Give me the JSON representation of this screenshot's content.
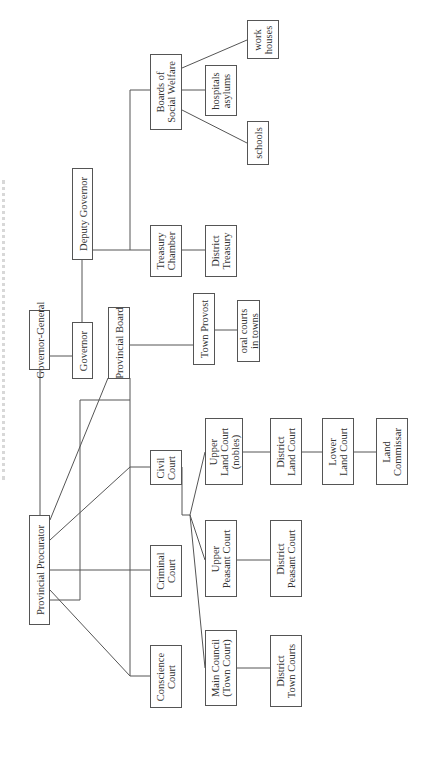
{
  "title": "",
  "line_color": "#555555",
  "nodes": {
    "governor_general": {
      "label": "Governor-General",
      "x": 29,
      "y": 310,
      "w": 21,
      "h": 60
    },
    "provincial_procurator": {
      "label": "Provincial Procurator",
      "x": 29,
      "y": 515,
      "w": 21,
      "h": 110
    },
    "governor": {
      "label": "Governor",
      "x": 72,
      "y": 322,
      "w": 21,
      "h": 57
    },
    "deputy_governor": {
      "label": "Deputy Governor",
      "x": 72,
      "y": 168,
      "w": 21,
      "h": 92
    },
    "provincial_board": {
      "label": "Provincial Board",
      "x": 108,
      "y": 307,
      "w": 22,
      "h": 72
    },
    "town_provost": {
      "label": "Town Provost",
      "x": 193,
      "y": 293,
      "w": 22,
      "h": 72
    },
    "oral_courts": {
      "label": "oral courts\nin towns",
      "x": 237,
      "y": 300,
      "w": 23,
      "h": 62
    },
    "treasury_chamber": {
      "label": "Treasury\nChamber",
      "x": 150,
      "y": 225,
      "w": 32,
      "h": 52
    },
    "district_treasury": {
      "label": "District\nTreasury",
      "x": 205,
      "y": 225,
      "w": 32,
      "h": 52
    },
    "boards_social_welfare": {
      "label": "Boards of\nSocial Welfare",
      "x": 150,
      "y": 54,
      "w": 32,
      "h": 76
    },
    "schools": {
      "label": "schools",
      "x": 247,
      "y": 121,
      "w": 22,
      "h": 44
    },
    "hospitals_asylums": {
      "label": "hospitals\nasylums",
      "x": 205,
      "y": 65,
      "w": 32,
      "h": 51
    },
    "work_houses": {
      "label": "work\nhouses",
      "x": 247,
      "y": 20,
      "w": 32,
      "h": 39
    },
    "conscience_court": {
      "label": "Conscience\nCourt",
      "x": 150,
      "y": 645,
      "w": 32,
      "h": 63
    },
    "criminal_court": {
      "label": "Criminal\nCourt",
      "x": 150,
      "y": 545,
      "w": 32,
      "h": 52
    },
    "civil_court": {
      "label": "Civil\nCourt",
      "x": 150,
      "y": 450,
      "w": 32,
      "h": 35
    },
    "main_council": {
      "label": "Main Council\n(Town Court)",
      "x": 205,
      "y": 630,
      "w": 32,
      "h": 76
    },
    "upper_peasant_court": {
      "label": "Upper\nPeasant Court",
      "x": 205,
      "y": 520,
      "w": 32,
      "h": 77
    },
    "upper_land_court": {
      "label": "Upper\nLand Court\n(nobles)",
      "x": 205,
      "y": 418,
      "w": 38,
      "h": 67
    },
    "district_town_courts": {
      "label": "District\nTown Courts",
      "x": 270,
      "y": 635,
      "w": 32,
      "h": 72
    },
    "district_peasant_court": {
      "label": "District\nPeasant Court",
      "x": 270,
      "y": 520,
      "w": 32,
      "h": 77
    },
    "district_land_court": {
      "label": "District\nLand Court",
      "x": 270,
      "y": 418,
      "w": 32,
      "h": 67
    },
    "lower_land_court": {
      "label": "Lower\nLand Court",
      "x": 322,
      "y": 418,
      "w": 32,
      "h": 67
    },
    "land_commissar": {
      "label": "Land\nCommissar",
      "x": 376,
      "y": 418,
      "w": 32,
      "h": 67
    }
  },
  "edges": [
    [
      40,
      370,
      40,
      515
    ],
    [
      50,
      356,
      72,
      356
    ],
    [
      82,
      322,
      82,
      260
    ],
    [
      93,
      250,
      130,
      250
    ],
    [
      50,
      520,
      108,
      378
    ],
    [
      50,
      600,
      80,
      600
    ],
    [
      80,
      600,
      80,
      400
    ],
    [
      40,
      560,
      40,
      560
    ],
    [
      130,
      345,
      193,
      345
    ],
    [
      215,
      330,
      237,
      330
    ],
    [
      182,
      250,
      205,
      250
    ],
    [
      130,
      250,
      130,
      90
    ],
    [
      130,
      250,
      150,
      250
    ],
    [
      130,
      90,
      150,
      90
    ],
    [
      182,
      68,
      247,
      40
    ],
    [
      182,
      90,
      205,
      90
    ],
    [
      182,
      110,
      247,
      143
    ],
    [
      50,
      540,
      130,
      467
    ],
    [
      50,
      570,
      130,
      570
    ],
    [
      50,
      590,
      130,
      676
    ],
    [
      130,
      467,
      130,
      676
    ],
    [
      130,
      467,
      150,
      467
    ],
    [
      130,
      570,
      150,
      570
    ],
    [
      130,
      676,
      150,
      676
    ],
    [
      182,
      467,
      182,
      515
    ],
    [
      182,
      515,
      190,
      515
    ],
    [
      190,
      515,
      205,
      452
    ],
    [
      190,
      515,
      205,
      560
    ],
    [
      190,
      515,
      205,
      668
    ],
    [
      237,
      668,
      270,
      668
    ],
    [
      237,
      560,
      270,
      560
    ],
    [
      243,
      452,
      270,
      452
    ],
    [
      302,
      452,
      322,
      452
    ],
    [
      354,
      452,
      376,
      452
    ],
    [
      130,
      378,
      130,
      467
    ],
    [
      80,
      400,
      130,
      400
    ]
  ]
}
